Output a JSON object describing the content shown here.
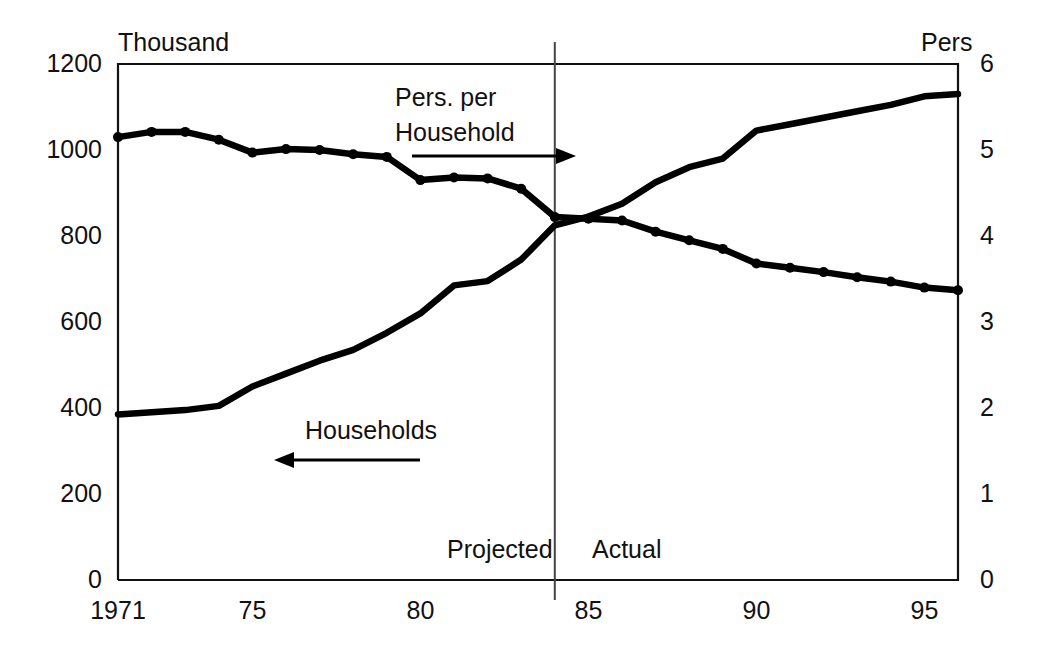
{
  "chart_data": {
    "type": "line",
    "title": "",
    "xlabel": "",
    "ylabel": "Thousand",
    "y2label": "Pers",
    "xlim": [
      1971,
      1996
    ],
    "ylim": [
      0,
      1200
    ],
    "y2lim": [
      0,
      6
    ],
    "grid": false,
    "legend_position": "inline-annotations",
    "x_ticks": [
      {
        "value": 1971,
        "label": "1971"
      },
      {
        "value": 1975,
        "label": "75"
      },
      {
        "value": 1980,
        "label": "80"
      },
      {
        "value": 1985,
        "label": "85"
      },
      {
        "value": 1990,
        "label": "90"
      },
      {
        "value": 1995,
        "label": "95"
      }
    ],
    "y_ticks_left": [
      {
        "value": 0,
        "label": "0"
      },
      {
        "value": 200,
        "label": "200"
      },
      {
        "value": 400,
        "label": "400"
      },
      {
        "value": 600,
        "label": "600"
      },
      {
        "value": 800,
        "label": "800"
      },
      {
        "value": 1000,
        "label": "1000"
      },
      {
        "value": 1200,
        "label": "1200"
      }
    ],
    "y_ticks_right": [
      {
        "value": 0,
        "label": "0"
      },
      {
        "value": 1,
        "label": "1"
      },
      {
        "value": 2,
        "label": "2"
      },
      {
        "value": 3,
        "label": "3"
      },
      {
        "value": 4,
        "label": "4"
      },
      {
        "value": 5,
        "label": "5"
      },
      {
        "value": 6,
        "label": "6"
      }
    ],
    "x": [
      1971,
      1972,
      1973,
      1974,
      1975,
      1976,
      1977,
      1978,
      1979,
      1980,
      1981,
      1982,
      1983,
      1984,
      1985,
      1986,
      1987,
      1988,
      1989,
      1990,
      1991,
      1992,
      1993,
      1994,
      1995,
      1996
    ],
    "series": [
      {
        "name": "Households",
        "axis": "left",
        "units": "Thousand",
        "markers": false,
        "values": [
          385,
          390,
          395,
          405,
          450,
          480,
          510,
          535,
          575,
          620,
          685,
          695,
          745,
          825,
          845,
          875,
          925,
          960,
          980,
          1045,
          1060,
          1075,
          1090,
          1105,
          1125,
          1130
        ]
      },
      {
        "name": "Pers. per Household",
        "axis": "right",
        "units": "Pers",
        "markers": true,
        "values": [
          5.15,
          5.21,
          5.21,
          5.12,
          4.97,
          5.01,
          5.0,
          4.95,
          4.92,
          4.65,
          4.68,
          4.67,
          4.55,
          4.22,
          4.2,
          4.18,
          4.05,
          3.95,
          3.85,
          3.68,
          3.63,
          3.58,
          3.52,
          3.47,
          3.4,
          3.37
        ]
      }
    ],
    "annotations": [
      {
        "name": "pers-per-household-label",
        "text_line1": "Pers. per",
        "text_line2": "Household",
        "arrow": "right"
      },
      {
        "name": "households-label",
        "text": "Households",
        "arrow": "left"
      },
      {
        "name": "projected-label",
        "text": "Projected"
      },
      {
        "name": "actual-label",
        "text": "Actual"
      }
    ],
    "divider": {
      "x_value": 1984,
      "left_region": "Projected",
      "right_region": "Actual"
    },
    "colors": {
      "line": "#000000",
      "frame": "#111111",
      "divider": "#444444",
      "background": "#ffffff"
    }
  },
  "axes": {
    "left_title": "Thousand",
    "right_title": "Pers"
  },
  "annotations": {
    "pers_per_household_line1": "Pers. per",
    "pers_per_household_line2": "Household",
    "households": "Households",
    "projected": "Projected",
    "actual": "Actual"
  }
}
